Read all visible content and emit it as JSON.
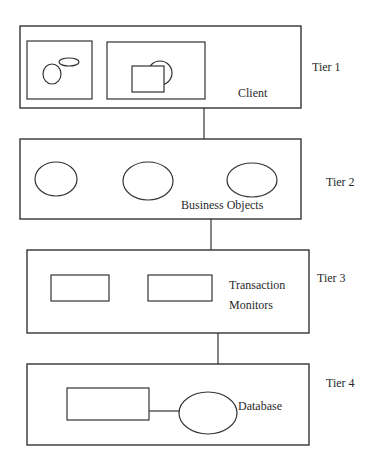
{
  "diagram": {
    "type": "four-tier architecture",
    "tiers": [
      {
        "tier_label": "Tier 1",
        "name": "Client"
      },
      {
        "tier_label": "Tier 2",
        "name": "Business Objects"
      },
      {
        "tier_label": "Tier 3",
        "name_line1": "Transaction",
        "name_line2": "Monitors"
      },
      {
        "tier_label": "Tier 4",
        "name": "Database"
      }
    ],
    "colors": {
      "stroke": "#333333",
      "background": "#ffffff",
      "text": "#2a2a2a"
    }
  }
}
